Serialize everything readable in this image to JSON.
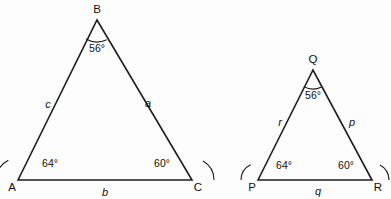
{
  "figure": {
    "background_color": "#fdfdfd",
    "stroke_color": "#1d1d1d",
    "text_color": "#111111"
  },
  "triangles": [
    {
      "id": "triangle-abc",
      "name": "ABC",
      "vertices": [
        {
          "label": "A",
          "x": 18,
          "y": 180,
          "label_x": 12,
          "label_y": 188
        },
        {
          "label": "B",
          "x": 97,
          "y": 20,
          "label_x": 97,
          "label_y": 10
        },
        {
          "label": "C",
          "x": 192,
          "y": 180,
          "label_x": 198,
          "label_y": 188
        }
      ],
      "angles": [
        {
          "at": "A",
          "value": "64°",
          "label_x": 50,
          "label_y": 163,
          "arc_radius": 22,
          "start_deg": 180,
          "end_deg": 116
        },
        {
          "at": "B",
          "value": "56°",
          "label_x": 97,
          "label_y": 48,
          "arc_radius": 22,
          "start_deg": 296,
          "end_deg": 240
        },
        {
          "at": "C",
          "value": "60°",
          "label_x": 162,
          "label_y": 163,
          "arc_radius": 22,
          "start_deg": 0,
          "end_deg": 60
        }
      ],
      "sides": [
        {
          "label": "c",
          "between": "A-B",
          "label_x": 48,
          "label_y": 104
        },
        {
          "label": "a",
          "between": "B-C",
          "label_x": 148,
          "label_y": 103
        },
        {
          "label": "b",
          "between": "A-C",
          "label_x": 105,
          "label_y": 192
        }
      ]
    },
    {
      "id": "triangle-pqr",
      "name": "PQR",
      "vertices": [
        {
          "label": "P",
          "x": 258,
          "y": 180,
          "label_x": 252,
          "label_y": 188
        },
        {
          "label": "Q",
          "x": 313,
          "y": 70,
          "label_x": 313,
          "label_y": 60
        },
        {
          "label": "R",
          "x": 372,
          "y": 180,
          "label_x": 378,
          "label_y": 188
        }
      ],
      "angles": [
        {
          "at": "P",
          "value": "64°",
          "label_x": 284,
          "label_y": 165,
          "arc_radius": 17,
          "start_deg": 180,
          "end_deg": 116
        },
        {
          "at": "Q",
          "value": "56°",
          "label_x": 313,
          "label_y": 95,
          "arc_radius": 19,
          "start_deg": 297,
          "end_deg": 241
        },
        {
          "at": "R",
          "value": "60°",
          "label_x": 346,
          "label_y": 165,
          "arc_radius": 17,
          "start_deg": 0,
          "end_deg": 62
        }
      ],
      "sides": [
        {
          "label": "r",
          "between": "P-Q",
          "label_x": 280,
          "label_y": 122
        },
        {
          "label": "p",
          "between": "Q-R",
          "label_x": 352,
          "label_y": 122
        },
        {
          "label": "q",
          "between": "P-R",
          "label_x": 318,
          "label_y": 191
        }
      ]
    }
  ]
}
